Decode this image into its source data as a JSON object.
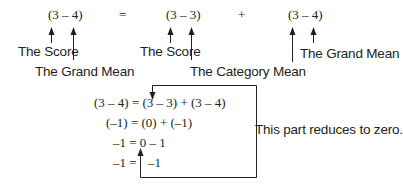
{
  "top_equation": {
    "left_term": "(3 – 4)",
    "equals": "=",
    "middle_term": "(3 – 3)",
    "plus": "+",
    "right_term": "(3 – 4)"
  },
  "annotations": {
    "left_score": "The Score",
    "left_grand_mean": "The Grand Mean",
    "middle_score": "The Score",
    "middle_category_mean": "The Category Mean",
    "right_grand_mean": "The Grand Mean"
  },
  "derivation": {
    "row1": "(3 – 4) = (3 – 3) + (3 – 4)",
    "row2": "(–1) = (0) + (–1)",
    "row3": "–1 = 0 – 1",
    "row4_left": "–1 =",
    "row4_right": "–1"
  },
  "callout": {
    "text": "This part reduces to zero."
  },
  "colors": {
    "ink": "#231f20",
    "background": "#ffffff"
  }
}
